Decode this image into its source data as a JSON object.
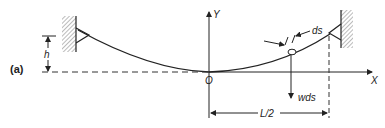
{
  "figure": {
    "panel_label": "(a)",
    "labels": {
      "y_axis": "Y",
      "x_axis": "X",
      "origin": "O",
      "height": "h",
      "element_length": "ds",
      "element_weight": "wds",
      "half_span": "L/2"
    },
    "colors": {
      "line": "#222222",
      "hatch": "#555555",
      "background": "#ffffff"
    }
  }
}
